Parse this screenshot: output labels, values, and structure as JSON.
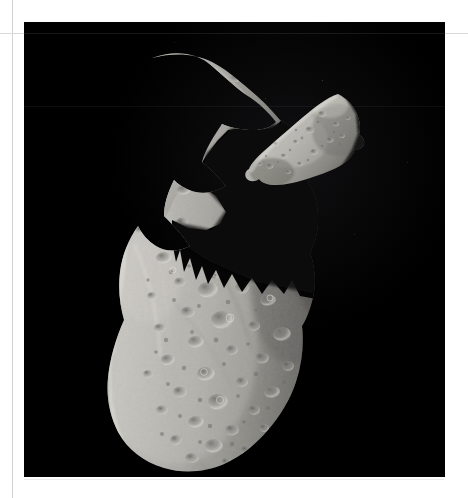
{
  "page": {
    "background_color": "#ffffff",
    "rule_line_color": "#d5d5d5",
    "photo_plate": {
      "background_color": "#000000",
      "left": 24,
      "top": 22,
      "width": 421,
      "height": 455
    }
  },
  "image": {
    "subject": "two-asteroid-photograph",
    "scene_type": "spacecraft photograph of asteroid and its moon against black space",
    "lighting": "strong side lighting from the left, deep shadow terminator on the right",
    "palette": {
      "space": "#000000",
      "surface_highlight": "#d7d6d2",
      "surface_midtone": "#9a9a96",
      "surface_shadow": "#3a3a38",
      "terminator_black": "#050505",
      "star_gray": "#8d8d8d"
    },
    "bodies": [
      {
        "name": "primary-asteroid",
        "label": "large irregular cratered asteroid",
        "position": "left of frame, vertically elongated, spanning nearly full plate height",
        "surface": "densely cratered regolith with ridges and a jagged shadowed terminator bearing sawtooth mountain shadows",
        "crater_count_visible": 120
      },
      {
        "name": "secondary-asteroid-moon",
        "label": "small companion moon",
        "position": "upper right of frame",
        "surface": "egg-shaped, moderately cratered, bright limb on the upper left",
        "crater_count_visible": 26
      }
    ],
    "features": [
      {
        "name": "terminator-line",
        "description": "sharp day/night boundary cutting diagonally across the primary body"
      },
      {
        "name": "mountain-shadow-teeth",
        "description": "three to four triangular peak shadows projecting into the dark side"
      },
      {
        "name": "bright-limb",
        "description": "sunlit left edge of both bodies"
      }
    ]
  },
  "overlay": {
    "vertical_rule": {
      "x": 12,
      "color": "#d2d2d2"
    },
    "horizontal_rule": {
      "y": 33,
      "color": "#d9d9d9"
    },
    "lower_rule": {
      "y": 479,
      "color": "#ececec"
    }
  }
}
